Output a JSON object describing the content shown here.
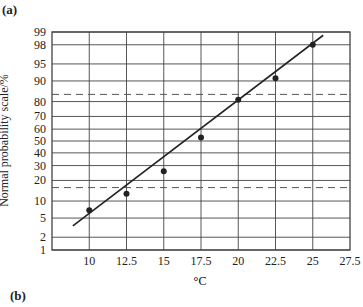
{
  "panels": {
    "top_label": "(a)",
    "bottom_label": "(b)"
  },
  "chart_data": {
    "type": "scatter",
    "title": "",
    "xlabel": "°C",
    "ylabel": "Normal probability scale/%",
    "x_ticks": [
      10,
      12.5,
      15,
      17.5,
      20,
      22.5,
      25,
      27.5
    ],
    "x_tick_labels": [
      "10",
      "12.5",
      "15",
      "17.5",
      "20",
      "22.5",
      "25",
      "27.5"
    ],
    "y_ticks": [
      1,
      2,
      5,
      10,
      20,
      30,
      40,
      50,
      60,
      70,
      80,
      90,
      95,
      98,
      99
    ],
    "y_tick_labels": [
      "1",
      "2",
      "5",
      "10",
      "20",
      "30",
      "40",
      "50",
      "60",
      "70",
      "80",
      "90",
      "95",
      "98",
      "99"
    ],
    "y_scale": "normal-probability",
    "xlim": [
      7.5,
      27.5
    ],
    "ylim": [
      1,
      99
    ],
    "grid": true,
    "legend": null,
    "series": [
      {
        "name": "observations",
        "kind": "points",
        "x": [
          10,
          12.5,
          15,
          17.5,
          20,
          22.5,
          25
        ],
        "y": [
          7,
          13,
          26,
          53,
          81,
          91,
          98
        ]
      },
      {
        "name": "fitted line",
        "kind": "line",
        "x": [
          8.9,
          25.7
        ],
        "y": [
          3.5,
          98.8
        ]
      }
    ],
    "reference_lines": [
      {
        "style": "dashed",
        "orientation": "horizontal",
        "y": 84
      },
      {
        "style": "dashed",
        "orientation": "horizontal",
        "y": 16
      }
    ]
  }
}
